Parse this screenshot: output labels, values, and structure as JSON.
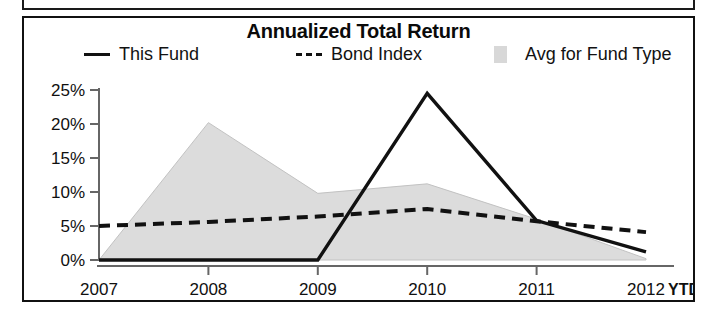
{
  "chart_data": {
    "type": "line",
    "title": "Annualized Total Return",
    "xlabel": "",
    "ylabel": "",
    "categories": [
      "2007",
      "2008",
      "2009",
      "2010",
      "2011",
      "2012 YTD"
    ],
    "x_tick_labels": [
      "2007",
      "2008",
      "2009",
      "2010",
      "2011",
      "2012"
    ],
    "x_tick_suffix": "YTD",
    "y_tick_labels": [
      "0%",
      "5%",
      "10%",
      "15%",
      "20%",
      "25%"
    ],
    "y_tick_values": [
      0,
      5,
      10,
      15,
      20,
      25
    ],
    "ylim": [
      0,
      25
    ],
    "grid": false,
    "legend_position": "top",
    "series": [
      {
        "name": "This Fund",
        "style": "solid",
        "color": "#111111",
        "values": [
          0.0,
          0.0,
          0.0,
          24.5,
          5.8,
          1.2
        ]
      },
      {
        "name": "Bond Index",
        "style": "dashed",
        "color": "#111111",
        "values": [
          5.0,
          5.6,
          6.4,
          7.5,
          5.7,
          4.1
        ]
      },
      {
        "name": "Avg for Fund Type",
        "style": "area",
        "color": "#d8d8d8",
        "values": [
          0.0,
          20.2,
          9.8,
          11.2,
          6.0,
          0.2
        ]
      }
    ]
  },
  "legend": {
    "this_fund": "This Fund",
    "bond_index": "Bond Index",
    "avg_for_fund_type": "Avg for Fund Type"
  },
  "colors": {
    "line": "#111111",
    "area_fill": "#d8d8d8",
    "axis": "#555555",
    "border": "#111111"
  }
}
